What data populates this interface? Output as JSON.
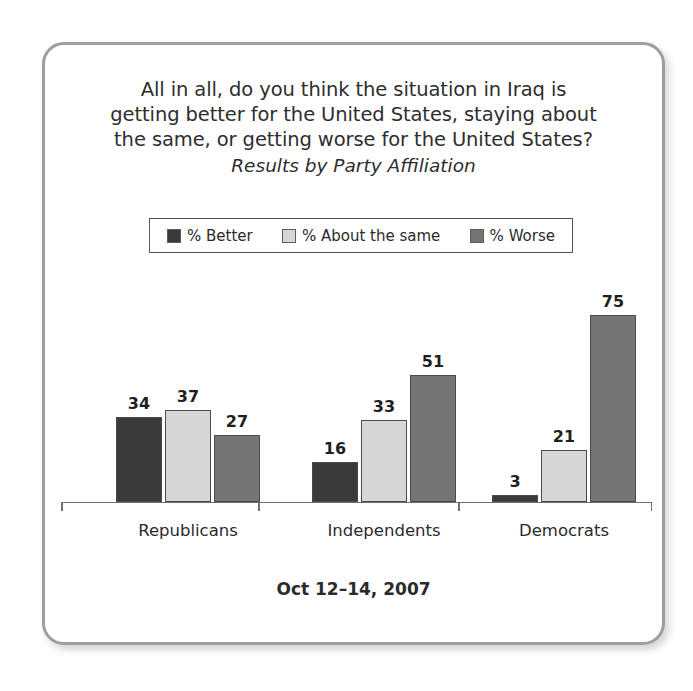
{
  "card": {
    "border_color": "#9e9e9e",
    "background": "#ffffff"
  },
  "title": {
    "line1": "All in all, do you think the situation in Iraq is",
    "line2": "getting better for the United States, staying about",
    "line3": "the same, or getting worse for the United States?",
    "subtitle": "Results by Party Affiliation"
  },
  "legend": {
    "items": [
      {
        "label": "% Better",
        "color": "#3a3a3a"
      },
      {
        "label": "% About the same",
        "color": "#d6d6d6"
      },
      {
        "label": "% Worse",
        "color": "#757575"
      }
    ]
  },
  "footer": {
    "date": "Oct 12–14, 2007"
  },
  "chart_data": {
    "type": "bar",
    "title": "All in all, do you think the situation in Iraq is getting better for the United States, staying about the same, or getting worse for the United States?",
    "subtitle": "Results by Party Affiliation",
    "xlabel": "",
    "ylabel": "",
    "ylim": [
      0,
      80
    ],
    "grid": false,
    "legend_position": "top",
    "annotation": "Oct 12–14, 2007",
    "categories": [
      "Republicans",
      "Independents",
      "Democrats"
    ],
    "series": [
      {
        "name": "% Better",
        "color": "#3a3a3a",
        "values": [
          34,
          16,
          3
        ]
      },
      {
        "name": "% About the same",
        "color": "#d6d6d6",
        "values": [
          37,
          33,
          21
        ]
      },
      {
        "name": "% Worse",
        "color": "#757575",
        "values": [
          27,
          51,
          75
        ]
      }
    ],
    "data_labels": [
      [
        "34",
        "37",
        "27"
      ],
      [
        "16",
        "33",
        "51"
      ],
      [
        "3",
        "21",
        "75"
      ]
    ]
  }
}
